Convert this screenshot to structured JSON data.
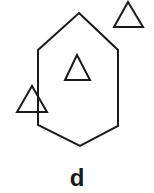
{
  "figure": {
    "label": "d",
    "stroke_color": "#1a1a1a",
    "background": "#ffffff",
    "hexagon": {
      "points": "79,13 118,50 118,126 80,146 38,125 38,50"
    },
    "triangles": [
      {
        "name": "top-right",
        "points": "128,2 114,27 143,27"
      },
      {
        "name": "center",
        "points": "77,55 65,80 90,80"
      },
      {
        "name": "left-overlapping",
        "points": "32,86 17,112 47,112"
      }
    ]
  }
}
